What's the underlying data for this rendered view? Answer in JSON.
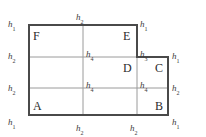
{
  "figure": {
    "colors": {
      "outline": "#4a4a4a",
      "grid": "#9a9a9a",
      "background": "#ffffff",
      "text": "#2b2b2b"
    },
    "outline_polygon": [
      {
        "x": 29,
        "y": 115,
        "vertex": "A"
      },
      {
        "x": 168,
        "y": 115,
        "vertex": "B"
      },
      {
        "x": 168,
        "y": 57,
        "vertex": "C"
      },
      {
        "x": 137,
        "y": 57,
        "vertex": "D"
      },
      {
        "x": 137,
        "y": 25,
        "vertex": "E"
      },
      {
        "x": 29,
        "y": 25,
        "vertex": "F"
      }
    ],
    "grid_lines": [
      {
        "name": "horizontal-upper",
        "x1": 29,
        "y1": 57,
        "x2": 168,
        "y2": 57
      },
      {
        "name": "horizontal-lower",
        "x1": 29,
        "y1": 88,
        "x2": 168,
        "y2": 88
      },
      {
        "name": "vertical-middle",
        "x1": 83,
        "y1": 25,
        "x2": 83,
        "y2": 115
      },
      {
        "name": "vertical-right",
        "x1": 137,
        "y1": 57,
        "x2": 137,
        "y2": 115
      }
    ],
    "vertex_labels": [
      {
        "name": "vertex-label-a",
        "text": "A",
        "x": 33,
        "y": 100
      },
      {
        "name": "vertex-label-b",
        "text": "B",
        "x": 155,
        "y": 100
      },
      {
        "name": "vertex-label-c",
        "text": "C",
        "x": 155,
        "y": 62
      },
      {
        "name": "vertex-label-d",
        "text": "D",
        "x": 123,
        "y": 62
      },
      {
        "name": "vertex-label-e",
        "text": "E",
        "x": 123,
        "y": 30
      },
      {
        "name": "vertex-label-f",
        "text": "F",
        "x": 33,
        "y": 30
      }
    ],
    "edge_labels": [
      {
        "name": "edge-label-top-left-corner",
        "base": "h",
        "sub": "1",
        "x": 8,
        "y": 20
      },
      {
        "name": "edge-label-top-edge",
        "base": "h",
        "sub": "2",
        "x": 76,
        "y": 13
      },
      {
        "name": "edge-label-top-right-corner",
        "base": "h",
        "sub": "1",
        "x": 140,
        "y": 20
      },
      {
        "name": "edge-label-left-upper",
        "base": "h",
        "sub": "2",
        "x": 8,
        "y": 52
      },
      {
        "name": "edge-label-left-lower",
        "base": "h",
        "sub": "2",
        "x": 8,
        "y": 84
      },
      {
        "name": "edge-label-bottom-left-corner",
        "base": "h",
        "sub": "1",
        "x": 8,
        "y": 118
      },
      {
        "name": "edge-label-bottom-left-edge",
        "base": "h",
        "sub": "2",
        "x": 76,
        "y": 124
      },
      {
        "name": "edge-label-bottom-right-edge",
        "base": "h",
        "sub": "2",
        "x": 130,
        "y": 124
      },
      {
        "name": "edge-label-bottom-right-corner",
        "base": "h",
        "sub": "1",
        "x": 172,
        "y": 118
      },
      {
        "name": "edge-label-right-upper",
        "base": "h",
        "sub": "1",
        "x": 172,
        "y": 52
      },
      {
        "name": "edge-label-right-lower",
        "base": "h",
        "sub": "2",
        "x": 172,
        "y": 84
      },
      {
        "name": "edge-label-step-vertical",
        "base": "h",
        "sub": "3",
        "x": 140,
        "y": 50
      },
      {
        "name": "edge-label-interior-upper",
        "base": "h",
        "sub": "4",
        "x": 86,
        "y": 50
      },
      {
        "name": "edge-label-interior-lower",
        "base": "h",
        "sub": "4",
        "x": 86,
        "y": 81
      },
      {
        "name": "edge-label-interior-right",
        "base": "h",
        "sub": "4",
        "x": 140,
        "y": 81
      }
    ]
  }
}
